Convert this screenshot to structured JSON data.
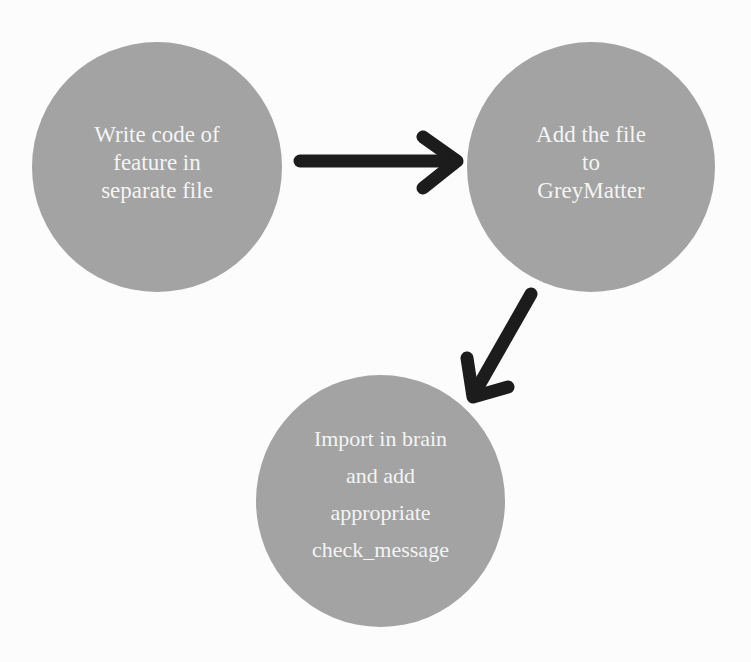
{
  "diagram": {
    "colors": {
      "node_fill": "#a3a3a3",
      "node_text": "#f4f4f4",
      "arrow": "#1c1c1c",
      "background": "#fcfcfc"
    },
    "nodes": [
      {
        "id": "write-code",
        "label": "Write code of\nfeature in\nseparate file"
      },
      {
        "id": "add-file",
        "label": "Add the file\nto\nGreyMatter"
      },
      {
        "id": "import-brain",
        "label": "Import in brain\nand add\nappropriate\ncheck_message"
      }
    ],
    "edges": [
      {
        "from": "write-code",
        "to": "add-file"
      },
      {
        "from": "add-file",
        "to": "import-brain"
      }
    ]
  }
}
